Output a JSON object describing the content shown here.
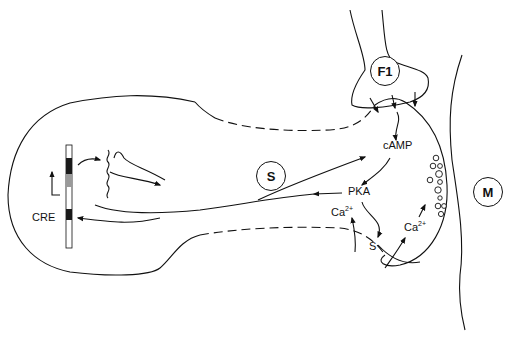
{
  "diagram": {
    "type": "neuron signaling schematic",
    "labels": {
      "sensory_neuron": "S",
      "facilitatory_interneuron": "F1",
      "motor_neuron": "M",
      "camp": "cAMP",
      "pka": "PKA",
      "calcium_left": "Ca",
      "calcium_left_charge": "2+",
      "calcium_right": "Ca",
      "calcium_right_charge": "2+",
      "s_channel": "S",
      "cre": "CRE"
    },
    "colors": {
      "line": "#111111",
      "background": "#ffffff",
      "dna_dark": "#1a1a1a",
      "dna_grey": "#9a9a9a"
    }
  }
}
